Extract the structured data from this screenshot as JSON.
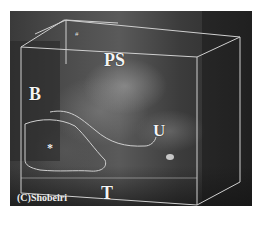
{
  "image": {
    "description": "3D ultrasound volume rendering inside a wireframe box",
    "labels": {
      "ps": "PS",
      "b": "B",
      "u": "U",
      "t": "T",
      "star": "*",
      "marker": "#"
    },
    "copyright": "(C)Shobeiri"
  },
  "colors": {
    "background": "#ffffff",
    "scan_base": "#4a4a4a",
    "wireframe": "#cfcfcf",
    "label": "#f4f4f4"
  }
}
